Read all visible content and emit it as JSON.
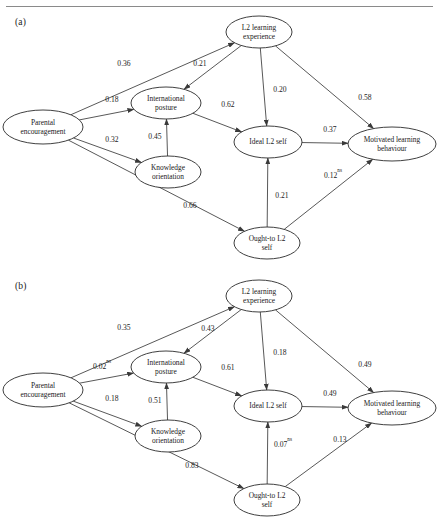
{
  "figure": {
    "type": "path-diagram",
    "panels": [
      {
        "id": "a",
        "label": "(a)",
        "nodes": [
          {
            "id": "parental",
            "label_line1": "Parental",
            "label_line2": "encouragement",
            "cx": 43,
            "cy": 127,
            "rx": 40,
            "ry": 17
          },
          {
            "id": "intl",
            "label_line1": "International",
            "label_line2": "posture",
            "cx": 166,
            "cy": 103,
            "rx": 35,
            "ry": 16
          },
          {
            "id": "knowledge",
            "label_line1": "Knowledge",
            "label_line2": "orientation",
            "cx": 168,
            "cy": 172,
            "rx": 33,
            "ry": 16
          },
          {
            "id": "l2exp",
            "label_line1": "L2 learning",
            "label_line2": "experience",
            "cx": 259,
            "cy": 32,
            "rx": 33,
            "ry": 16
          },
          {
            "id": "ideal",
            "label_line1": "Ideal L2 self",
            "label_line2": "",
            "cx": 268,
            "cy": 142,
            "rx": 34,
            "ry": 16
          },
          {
            "id": "ought",
            "label_line1": "Ought-to L2",
            "label_line2": "self",
            "cx": 267,
            "cy": 243,
            "rx": 33,
            "ry": 16
          },
          {
            "id": "motivated",
            "label_line1": "Motivated learning",
            "label_line2": "behaviour",
            "cx": 392,
            "cy": 144,
            "rx": 44,
            "ry": 17
          }
        ],
        "edges": [
          {
            "from": "parental",
            "to": "l2exp",
            "value": "0.36",
            "ns": false,
            "lx": 124,
            "ly": 66
          },
          {
            "from": "parental",
            "to": "intl",
            "value": "0.18",
            "ns": false,
            "lx": 112,
            "ly": 102
          },
          {
            "from": "parental",
            "to": "knowledge",
            "value": "0.32",
            "ns": false,
            "lx": 112,
            "ly": 142
          },
          {
            "from": "parental",
            "to": "ought",
            "value": "0.66",
            "ns": false,
            "lx": 190,
            "ly": 208
          },
          {
            "from": "l2exp",
            "to": "intl",
            "value": "0.21",
            "ns": false,
            "lx": 200,
            "ly": 66
          },
          {
            "from": "l2exp",
            "to": "ideal",
            "value": "0.20",
            "ns": false,
            "lx": 280,
            "ly": 92
          },
          {
            "from": "l2exp",
            "to": "motivated",
            "value": "0.58",
            "ns": false,
            "lx": 365,
            "ly": 100
          },
          {
            "from": "knowledge",
            "to": "intl",
            "value": "0.45",
            "ns": false,
            "lx": 155,
            "ly": 139
          },
          {
            "from": "intl",
            "to": "ideal",
            "value": "0.62",
            "ns": false,
            "lx": 228,
            "ly": 107
          },
          {
            "from": "ideal",
            "to": "motivated",
            "value": "0.37",
            "ns": false,
            "lx": 330,
            "ly": 132
          },
          {
            "from": "ought",
            "to": "ideal",
            "value": "0.21",
            "ns": false,
            "lx": 282,
            "ly": 198
          },
          {
            "from": "ought",
            "to": "motivated",
            "value": "0.12",
            "ns": true,
            "lx": 333,
            "ly": 178
          }
        ]
      },
      {
        "id": "b",
        "label": "(b)",
        "nodes": [
          {
            "id": "parental",
            "label_line1": "Parental",
            "label_line2": "encouragement",
            "cx": 43,
            "cy": 390,
            "rx": 40,
            "ry": 17
          },
          {
            "id": "intl",
            "label_line1": "International",
            "label_line2": "posture",
            "cx": 166,
            "cy": 367,
            "rx": 35,
            "ry": 16
          },
          {
            "id": "knowledge",
            "label_line1": "Knowledge",
            "label_line2": "orientation",
            "cx": 168,
            "cy": 436,
            "rx": 33,
            "ry": 16
          },
          {
            "id": "l2exp",
            "label_line1": "L2 learning",
            "label_line2": "experience",
            "cx": 259,
            "cy": 296,
            "rx": 33,
            "ry": 16
          },
          {
            "id": "ideal",
            "label_line1": "Ideal L2 self",
            "label_line2": "",
            "cx": 268,
            "cy": 406,
            "rx": 34,
            "ry": 16
          },
          {
            "id": "ought",
            "label_line1": "Ought-to L2",
            "label_line2": "self",
            "cx": 267,
            "cy": 500,
            "rx": 33,
            "ry": 16
          },
          {
            "id": "motivated",
            "label_line1": "Motivated learning",
            "label_line2": "behaviour",
            "cx": 392,
            "cy": 408,
            "rx": 44,
            "ry": 17
          }
        ],
        "edges": [
          {
            "from": "parental",
            "to": "l2exp",
            "value": "0.35",
            "ns": false,
            "lx": 124,
            "ly": 330
          },
          {
            "from": "parental",
            "to": "intl",
            "value": "0.02",
            "ns": true,
            "lx": 102,
            "ly": 369
          },
          {
            "from": "parental",
            "to": "knowledge",
            "value": "0.18",
            "ns": false,
            "lx": 112,
            "ly": 401
          },
          {
            "from": "parental",
            "to": "ought",
            "value": "0.83",
            "ns": false,
            "lx": 192,
            "ly": 468
          },
          {
            "from": "l2exp",
            "to": "intl",
            "value": "0.43",
            "ns": false,
            "lx": 208,
            "ly": 331
          },
          {
            "from": "l2exp",
            "to": "ideal",
            "value": "0.18",
            "ns": false,
            "lx": 280,
            "ly": 355
          },
          {
            "from": "l2exp",
            "to": "motivated",
            "value": "0.49",
            "ns": false,
            "lx": 365,
            "ly": 367
          },
          {
            "from": "knowledge",
            "to": "intl",
            "value": "0.51",
            "ns": false,
            "lx": 155,
            "ly": 403
          },
          {
            "from": "intl",
            "to": "ideal",
            "value": "0.61",
            "ns": false,
            "lx": 228,
            "ly": 370
          },
          {
            "from": "ideal",
            "to": "motivated",
            "value": "0.49",
            "ns": false,
            "lx": 330,
            "ly": 396
          },
          {
            "from": "ought",
            "to": "ideal",
            "value": "0.07",
            "ns": true,
            "lx": 283,
            "ly": 447
          },
          {
            "from": "ought",
            "to": "motivated",
            "value": "0.13",
            "ns": false,
            "lx": 340,
            "ly": 442
          }
        ]
      }
    ],
    "ns_marker": "ns",
    "colors": {
      "stroke": "#2a2a2a",
      "edge": "#3a3a3a",
      "text": "#1a1a1a",
      "background": "#ffffff",
      "rule": "#8a8a8a"
    }
  }
}
